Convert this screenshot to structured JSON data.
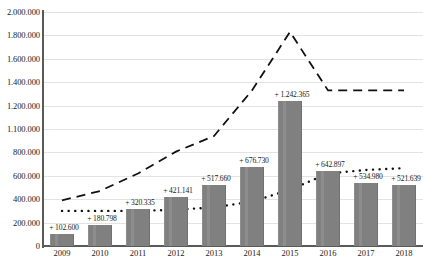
{
  "chart_data": {
    "type": "bar",
    "title": "",
    "subtitle": "",
    "xlabel": "",
    "ylabel": "",
    "categories": [
      "2009",
      "2010",
      "2011",
      "2012",
      "2013",
      "2014",
      "2015",
      "2016",
      "2017",
      "2018"
    ],
    "ylim": [
      0,
      2000000
    ],
    "ytick_labels": [
      "2.000.000",
      "1.800.000",
      "1.600.000",
      "1.400.000",
      "1.200.000",
      "1.100.000",
      "800.000",
      "600.000",
      "400.000",
      "200.000",
      "0"
    ],
    "ytick_values": [
      2000000,
      1800000,
      1600000,
      1400000,
      1200000,
      1100000,
      800000,
      600000,
      400000,
      200000,
      0
    ],
    "grid": true,
    "legend": "none",
    "series": [
      {
        "name": "bars",
        "style": "bar",
        "color": "#808080",
        "values": [
          102600,
          180798,
          320335,
          421141,
          517660,
          676730,
          1242365,
          642897,
          534980,
          521639
        ],
        "data_labels": [
          "+ 102.600",
          "+ 180.798",
          "+ 320.335",
          "+ 421.141",
          "+ 517.660",
          "+ 676.730",
          "+ 1.242.365",
          "+ 642.897",
          "+ 534.980",
          "+ 521.639"
        ]
      },
      {
        "name": "dashed-line",
        "style": "dashed",
        "color": "#111111",
        "values": [
          390000,
          470000,
          620000,
          810000,
          1010000,
          1330000,
          1830000,
          1330000,
          1330000,
          1330000
        ]
      },
      {
        "name": "dotted-line",
        "style": "dotted",
        "color": "#111111",
        "values": [
          300000,
          300000,
          300000,
          310000,
          330000,
          380000,
          480000,
          620000,
          650000,
          665000
        ]
      }
    ]
  },
  "axis": {
    "y_axis_color": "#5a5a5a",
    "x_axis_color": "#5a5a5a",
    "gridline_color": "#e3e3e3"
  }
}
